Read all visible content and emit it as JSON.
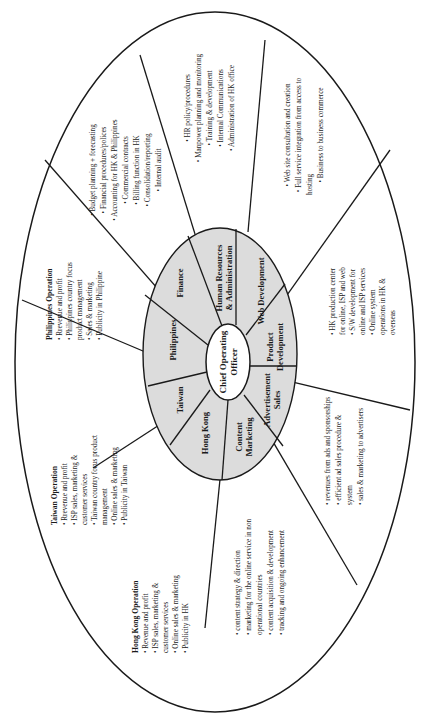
{
  "diagram": {
    "type": "organizational-wheel",
    "orientation": "rotated -90deg",
    "center": {
      "label_line1": "Chief Operating",
      "label_line2": "Officer"
    },
    "segments": [
      {
        "id": "finance",
        "label_line1": "Finance",
        "label_line2": ""
      },
      {
        "id": "hr",
        "label_line1": "Human Resources",
        "label_line2": "& Administration"
      },
      {
        "id": "web",
        "label_line1": "Web Development",
        "label_line2": ""
      },
      {
        "id": "product",
        "label_line1": "Product",
        "label_line2": "Development"
      },
      {
        "id": "adsales",
        "label_line1": "Advertisement",
        "label_line2": "Sales"
      },
      {
        "id": "content",
        "label_line1": "Content",
        "label_line2": "Marketing"
      },
      {
        "id": "hongkong",
        "label_line1": "Hong Kong",
        "label_line2": ""
      },
      {
        "id": "taiwan",
        "label_line1": "Taiwan",
        "label_line2": ""
      },
      {
        "id": "philippines",
        "label_line1": "Philippines",
        "label_line2": ""
      }
    ],
    "responsibilities": {
      "finance": {
        "heading": "",
        "lines": [
          "• Budget planning + forecasting",
          "• Financial procedures/polices",
          "• Accounting for HK & Philippines",
          "• Commercial contracts",
          "• Billing function in HK",
          "• Consolidation/reporting",
          "• Internal audit"
        ]
      },
      "hr": {
        "heading": "",
        "lines": [
          "• HR policy/procedures",
          "• Manpower planning and monitoring",
          "• Training & development",
          "• Internal Communications",
          "• Administration of HK office"
        ]
      },
      "web": {
        "heading": "",
        "lines": [
          "• Web site consultation and creation",
          "• Full service integration from access to",
          "hosting",
          "• Business to business commerce"
        ]
      },
      "product": {
        "heading": "",
        "lines": [
          "• HK production center",
          "for online, ISP and web",
          "• S/W development for",
          "online and ISP services",
          "• Online system",
          "operations in HK &",
          "overseas"
        ]
      },
      "adsales": {
        "heading": "",
        "lines": [
          "• revenues from ads and sponsorships",
          "• efficient ad sales procedure &",
          "system",
          "• sales & marketing  to advertisers"
        ]
      },
      "content": {
        "heading": "",
        "lines": [
          "• content strategy & direction",
          "• marketing for the online service in non",
          "operational countries",
          "• content acquisition & development",
          "• tracking and ongoing enhancement"
        ]
      },
      "hongkong": {
        "heading": "Hong Kong Operation",
        "lines": [
          "• Revenue and profit",
          "• ISP sales, marketing &",
          "customer services",
          "• Online sales & marketing",
          "• Publicity in HK"
        ]
      },
      "taiwan": {
        "heading": "Taiwan Operation",
        "lines": [
          "• Rrevenue and profit",
          "• ISP sales, marketing &",
          "customer services",
          "• Taiwan country focus product",
          "management",
          "• Online sales & marketing",
          "• Publicity  in Taiwan"
        ]
      },
      "philippines": {
        "heading": "Philippines Operation",
        "lines": [
          "• Rrevenue and profit",
          "• Philippines country focus",
          "product management",
          "• Sales & marketing",
          "• Publicity in Philippine"
        ]
      }
    }
  }
}
